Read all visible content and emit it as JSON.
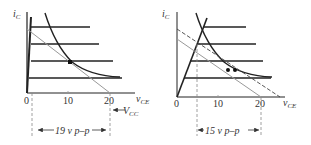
{
  "diagrams": [
    {
      "id": "left",
      "y_axis_label": "i",
      "y_axis_sub": "C",
      "x_axis_label": "v",
      "x_axis_sub": "CE",
      "ticks": [
        "0",
        "10",
        "20"
      ],
      "supply_label": "V",
      "supply_sub": "CC",
      "swing_label": "19 v p–p",
      "q_points": 1
    },
    {
      "id": "right",
      "y_axis_label": "i",
      "y_axis_sub": "C",
      "x_axis_label": "v",
      "x_axis_sub": "CE",
      "ticks": [
        "0",
        "10",
        "20"
      ],
      "swing_label": "15 v p–p",
      "q_points": 2
    }
  ],
  "colors": {
    "ink": "#222222",
    "gray_line": "#999999"
  }
}
